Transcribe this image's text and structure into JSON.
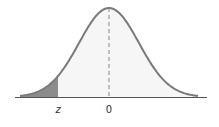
{
  "diagram": {
    "type": "normal-distribution-curve",
    "labels": {
      "z": "z",
      "zero": "0"
    },
    "shaded_region": "left tail (area to the left of z)",
    "colors": {
      "curve_stroke": "#7a7a7a",
      "curve_fill": "#f6f6f6",
      "tail_fill": "#8c8c8c",
      "axis": "#555555",
      "mean_line": "#888888"
    }
  }
}
